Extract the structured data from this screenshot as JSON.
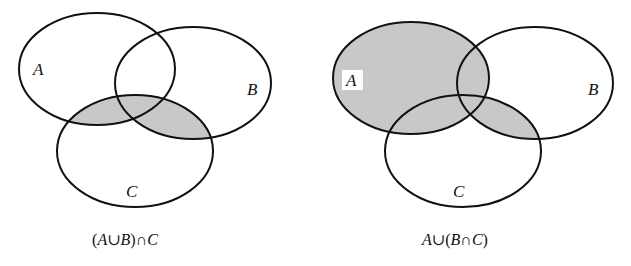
{
  "diagrams": [
    {
      "id": "left",
      "caption": "(A∪B)∩C",
      "caption_parts": [
        "(",
        "A",
        "∪",
        "B",
        ")∩",
        "C"
      ],
      "labels": {
        "A": "A",
        "B": "B",
        "C": "C"
      },
      "shaded_region": "(A∪B)∩C",
      "shade_color": "#c8c8c8"
    },
    {
      "id": "right",
      "caption": "A∪(B∩C)",
      "caption_parts": [
        "A",
        "∪(",
        "B",
        "∩",
        "C",
        ")"
      ],
      "labels": {
        "A": "A",
        "B": "B",
        "C": "C"
      },
      "shaded_region": "A∪(B∩C)",
      "shade_color": "#c8c8c8"
    }
  ],
  "colors": {
    "stroke": "#111111",
    "shade": "#c8c8c8",
    "background": "#ffffff"
  }
}
